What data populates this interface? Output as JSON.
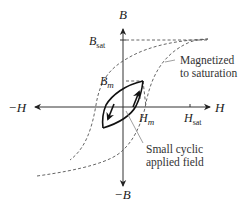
{
  "diagram": {
    "type": "magnetic-hysteresis",
    "axes": {
      "y_pos": "B",
      "y_neg": "−B",
      "x_pos": "H",
      "x_neg": "−H"
    },
    "markers": {
      "b_sat": {
        "base": "B",
        "sub": "sat"
      },
      "b_m": {
        "base": "B",
        "sub": "m"
      },
      "h_m": {
        "base": "H",
        "sub": "m"
      },
      "h_sat": {
        "base": "H",
        "sub": "sat"
      }
    },
    "annotations": {
      "saturation": [
        "Magnetized",
        "to saturation"
      ],
      "cyclic": [
        "Small cyclic",
        "applied field"
      ]
    },
    "colors": {
      "line": "#222222",
      "dashed": "#555555",
      "leader": "#888888"
    }
  }
}
